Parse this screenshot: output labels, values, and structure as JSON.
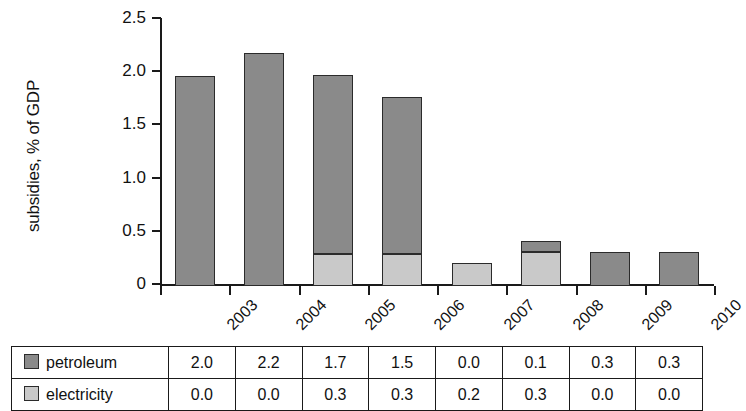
{
  "chart_data": {
    "type": "bar",
    "stacked": true,
    "title": "",
    "subtitle": "",
    "xlabel": "",
    "ylabel": "subsidies, % of GDP",
    "categories": [
      "2003",
      "2004",
      "2005",
      "2006",
      "2007",
      "2008",
      "2009",
      "2010"
    ],
    "series": [
      {
        "name": "petroleum",
        "color": "#8a8a8a",
        "values": [
          1.97,
          2.19,
          1.68,
          1.48,
          0.0,
          0.1,
          0.32,
          0.32
        ],
        "table_values": [
          "2.0",
          "2.2",
          "1.7",
          "1.5",
          "0.0",
          "0.1",
          "0.3",
          "0.3"
        ]
      },
      {
        "name": "electricity",
        "color": "#c9c9c9",
        "values": [
          0.0,
          0.0,
          0.3,
          0.3,
          0.22,
          0.32,
          0.0,
          0.0
        ],
        "table_values": [
          "0.0",
          "0.0",
          "0.3",
          "0.3",
          "0.2",
          "0.3",
          "0.0",
          "0.0"
        ]
      }
    ],
    "ylim": [
      0,
      2.5
    ],
    "yticks": [
      0,
      0.5,
      1.0,
      1.5,
      2.0,
      2.5
    ],
    "ytick_labels": [
      "0",
      "0.5",
      "1.0",
      "1.5",
      "2.0",
      "2.5"
    ],
    "grid": false,
    "legend_position": "table-row-labels"
  },
  "table": {
    "row_label_petroleum": "petroleum",
    "row_label_electricity": "electricity"
  }
}
